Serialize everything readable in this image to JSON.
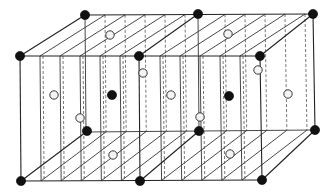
{
  "diagram": {
    "title": "",
    "colors": {
      "line": "#333333",
      "black_atom": "#111111",
      "white_atom": "#f4f4f4",
      "background": "#ffffff"
    },
    "corners": {
      "front_top": [
        [
          20,
          56
        ],
        [
          139,
          56
        ],
        [
          260,
          56
        ]
      ],
      "back_top": [
        [
          85,
          15
        ],
        [
          198,
          14
        ],
        [
          313,
          14
        ]
      ],
      "front_bottom": [
        [
          21,
          181
        ],
        [
          140,
          181
        ],
        [
          262,
          180
        ]
      ],
      "back_bottom": [
        [
          86,
          132
        ],
        [
          199,
          131
        ],
        [
          315,
          130
        ]
      ]
    },
    "plane_front_x": [
      40,
      60,
      80,
      100,
      120,
      160,
      180,
      200,
      220,
      240
    ],
    "plane_shear_dx": 22,
    "atoms": {
      "black": [
        [
          20,
          56
        ],
        [
          139,
          56
        ],
        [
          260,
          56
        ],
        [
          85,
          15
        ],
        [
          198,
          14
        ],
        [
          313,
          14
        ],
        [
          21,
          181
        ],
        [
          140,
          181
        ],
        [
          262,
          180
        ],
        [
          87,
          131
        ],
        [
          199,
          131
        ],
        [
          315,
          130
        ],
        [
          112,
          95
        ],
        [
          229,
          96
        ]
      ],
      "white": [
        [
          110,
          35
        ],
        [
          228,
          34
        ],
        [
          54,
          95
        ],
        [
          80,
          118
        ],
        [
          143,
          73
        ],
        [
          171,
          95
        ],
        [
          200,
          117
        ],
        [
          258,
          70
        ],
        [
          288,
          94
        ],
        [
          113,
          155
        ],
        [
          230,
          154
        ]
      ]
    }
  }
}
